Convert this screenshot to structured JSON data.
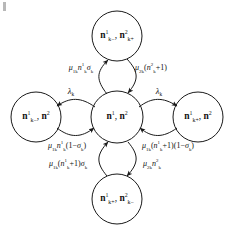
{
  "figure": {
    "type": "state-transition-diagram",
    "background_color": "#ffffff",
    "stroke_color": "#1a1a1a"
  },
  "nodes": {
    "center": {
      "id": "center-state",
      "text_html": "<span class=\"nsym\">n</span><sup>1</sup>, <span class=\"nsym\">n</span><sup>2</sup>",
      "plain": "n1, n2",
      "cx": 117,
      "cy": 117,
      "r": 26
    },
    "top": {
      "id": "top-state",
      "text_html": "<span class=\"nsym\">n</span><sup>1</sup><sub>k&minus;</sub>, <span class=\"nsym\">n</span><sup>2</sup><sub>k+</sub>",
      "plain": "n1_k-, n2_k+",
      "cx": 117,
      "cy": 36,
      "r": 25
    },
    "bottom": {
      "id": "bottom-state",
      "text_html": "<span class=\"nsym\">n</span><sup>1</sup><sub>k+</sub>, <span class=\"nsym\">n</span><sup>2</sup><sub>k&minus;</sub>",
      "plain": "n1_k+, n2_k-",
      "cx": 117,
      "cy": 199,
      "r": 25
    },
    "left": {
      "id": "left-state",
      "text_html": "<span class=\"nsym\">n</span><sup>1</sup><sub>k&minus;</sub>, <span class=\"nsym\">n</span><sup>2</sup>",
      "plain": "n1_k-, n2",
      "cx": 36,
      "cy": 117,
      "r": 25
    },
    "right": {
      "id": "right-state",
      "text_html": "<span class=\"nsym\">n</span><sup>1</sup><sub>k+</sub>, <span class=\"nsym\">n</span><sup>2</sup>",
      "plain": "n1_k+, n2",
      "cx": 198,
      "cy": 117,
      "r": 25
    }
  },
  "edge_labels": {
    "top_left": {
      "id": "rate-up-left",
      "text_html": "<span class=\"mv\">&mu;</span><sub>1k</sub><span class=\"mv\">n</span><sup>1</sup><sub>k</sub><span class=\"mv\">&sigma;</span><sub>k</sub>",
      "plain": "mu_1k n1_k sigma_k",
      "x": 81,
      "y": 68
    },
    "top_right": {
      "id": "rate-up-right",
      "text_html": "<span class=\"mv\">&mu;</span><sub>2k</sub>(<span class=\"mv\">n</span><sup>2</sup><sub>k</sub>+1)",
      "plain": "mu_2k(n2_k+1)",
      "x": 151,
      "y": 68
    },
    "left_lambda": {
      "id": "rate-left-lambda",
      "text_html": "<span class=\"mv\">&lambda;</span><sub>k</sub>",
      "plain": "lambda_k",
      "x": 71,
      "y": 91
    },
    "right_lambda": {
      "id": "rate-right-lambda",
      "text_html": "<span class=\"mv\">&lambda;</span><sub>k</sub>",
      "plain": "lambda_k",
      "x": 159,
      "y": 91
    },
    "bottom_left_upper": {
      "id": "rate-down-left-upper",
      "text_html": "<span class=\"mv\">&mu;</span><sub>1k</sub><span class=\"mv\">n</span><sup>1</sup><sub>k</sub>(1&minus;<span class=\"mv\">&sigma;</span><sub>k</sub>)",
      "plain": "mu_1k n1_k (1-sigma_k)",
      "x": 67,
      "y": 146
    },
    "bottom_left_lower": {
      "id": "rate-down-left-lower",
      "text_html": "<span class=\"mv\">&mu;</span><sub>1k</sub>(<span class=\"mv\">n</span><sup>1</sup><sub>k</sub>+1)<span class=\"mv\">&sigma;</span><sub>k</sub>",
      "plain": "mu_1k(n1_k+1)sigma_k",
      "x": 68,
      "y": 164
    },
    "bottom_right_upper": {
      "id": "rate-down-right-upper",
      "text_html": "<span class=\"mv\">&mu;</span><sub>1k</sub>(<span class=\"mv\">n</span><sup>1</sup><sub>k</sub>+1)(1&minus;<span class=\"mv\">&sigma;</span><sub>k</sub>)",
      "plain": "mu_1k(n1_k+1)(1-sigma_k)",
      "x": 168,
      "y": 146
    },
    "bottom_right_lower": {
      "id": "rate-down-right-lower",
      "text_html": "<span class=\"mv\">&mu;</span><sub>2k</sub><span class=\"mv\">n</span><sup>2</sup><sub>k</sub>",
      "plain": "mu_2k n2_k",
      "x": 152,
      "y": 164
    }
  }
}
